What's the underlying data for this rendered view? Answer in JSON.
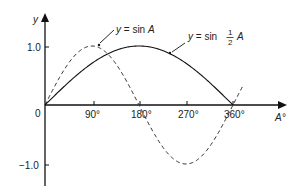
{
  "chart_data": {
    "type": "line",
    "title": "",
    "xlabel": "A°",
    "ylabel": "y",
    "xlim": [
      0,
      360
    ],
    "ylim": [
      -1.0,
      1.0
    ],
    "grid": false,
    "x_ticks": [
      "0",
      "90°",
      "180°",
      "270°",
      "360°"
    ],
    "y_ticks": [
      "1.0",
      "−1.0"
    ],
    "series": [
      {
        "name": "y = sin A",
        "style": "dashed",
        "x": [
          0,
          90,
          180,
          270,
          360
        ],
        "values": [
          0,
          1.0,
          0,
          -1.0,
          0
        ]
      },
      {
        "name": "y = sin ½ A",
        "style": "solid",
        "x": [
          0,
          90,
          180,
          270,
          360
        ],
        "values": [
          0,
          0.707,
          1.0,
          0.707,
          0
        ]
      }
    ],
    "annotations": [
      {
        "text_prefix": "y",
        "text_mid": " = sin ",
        "text_suffix": "A",
        "target_series": "y = sin A"
      },
      {
        "text_prefix": "y",
        "text_mid": " = sin ",
        "fraction_num": "1",
        "fraction_den": "2",
        "text_suffix": "A",
        "target_series": "y = sin ½ A"
      }
    ],
    "origin_label": "0"
  }
}
